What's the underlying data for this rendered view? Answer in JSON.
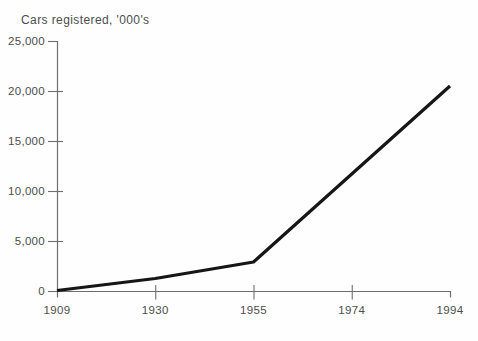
{
  "title": "Cars registered, '000's",
  "colors": {
    "background": "#fefefe",
    "text": "#4d4d4d",
    "axis": "#6e6e6e",
    "line": "#161616"
  },
  "chart_data": {
    "type": "line",
    "title": "Cars registered, '000's",
    "xlabel": "",
    "ylabel": "Cars registered, '000's",
    "x_tick_labels": [
      "1909",
      "1930",
      "1955",
      "1974",
      "1994"
    ],
    "y_tick_labels": [
      "0",
      "5,000",
      "10,000",
      "15,000",
      "20,000",
      "25,000"
    ],
    "ylim": [
      0,
      25000
    ],
    "y_tick_step": 5000,
    "grid": false,
    "legend": "none",
    "series": [
      {
        "name": "cars-registered",
        "points": [
          {
            "year": 1909,
            "value": 50
          },
          {
            "year": 1930,
            "value": 1250
          },
          {
            "year": 1955,
            "value": 2900
          },
          {
            "year": 1994,
            "value": 20500
          }
        ]
      }
    ],
    "note": "Single straight segment from 1955 to 1994 passes the 1974 tick at about 11,500"
  }
}
